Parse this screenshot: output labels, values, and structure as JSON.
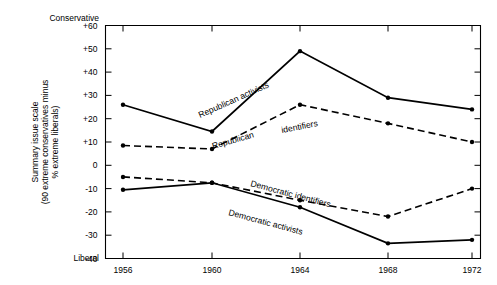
{
  "chart_data": {
    "type": "line",
    "title": "",
    "xlabel": "",
    "ylabel": "Summary issue scale (90 extreme conservatives minus % extreme liberals)",
    "categories": [
      "1956",
      "1960",
      "1964",
      "1968",
      "1972"
    ],
    "x": [
      1956,
      1960,
      1964,
      1968,
      1972
    ],
    "ylim": [
      -40,
      60
    ],
    "yticks": [
      "+60",
      "+50",
      "+40",
      "+30",
      "+20",
      "+10",
      "0",
      "-10",
      "-20",
      "-30",
      "-40"
    ],
    "ytick_values": [
      60,
      50,
      40,
      30,
      20,
      10,
      0,
      -10,
      -20,
      -30,
      -40
    ],
    "grid": false,
    "legend": "inline-labels",
    "axis_end_labels": {
      "top": "Conservative",
      "bottom": "Liberal"
    },
    "series": [
      {
        "name": "Republican activists",
        "style": "solid",
        "values": [
          26,
          14.5,
          49,
          29,
          24
        ]
      },
      {
        "name": "Republican identifiers",
        "style": "dashed",
        "values": [
          8.5,
          7,
          26,
          18,
          10
        ]
      },
      {
        "name": "Democratic identifiers",
        "style": "dashed",
        "values": [
          -5,
          -7.5,
          -15,
          -22,
          -10
        ]
      },
      {
        "name": "Democratic activists",
        "style": "solid",
        "values": [
          -10.5,
          -7.5,
          -18,
          -33.5,
          -32
        ]
      }
    ],
    "annotations": [
      {
        "text": "Republican activists",
        "series": "Republican activists"
      },
      {
        "text": "Republican",
        "series": "Republican identifiers"
      },
      {
        "text": "identifiers",
        "series": "Republican identifiers"
      },
      {
        "text": "Democratic identifiers",
        "series": "Democratic identifiers"
      },
      {
        "text": "Democratic activists",
        "series": "Democratic activists"
      }
    ],
    "colors": {
      "line": "#000000",
      "background": "#ffffff"
    }
  },
  "axis": {
    "y_title_line1": "Summary issue scale",
    "y_title_line2": "(90 extreme conservatives minus",
    "y_title_line3": "% extreme liberals)",
    "top_label": "Conservative",
    "bottom_label": "Liberal",
    "ticks": [
      "+60",
      "+50",
      "+40",
      "+30",
      "+20",
      "+10",
      "0",
      "-10",
      "-20",
      "-30",
      "-40"
    ],
    "years": [
      "1956",
      "1960",
      "1964",
      "1968",
      "1972"
    ]
  },
  "labels": {
    "republican_activists": "Republican activists",
    "republican": "Republican",
    "identifiers": "identifiers",
    "democratic_identifiers": "Democratic identifiers",
    "democratic_activists": "Democratic activists"
  }
}
